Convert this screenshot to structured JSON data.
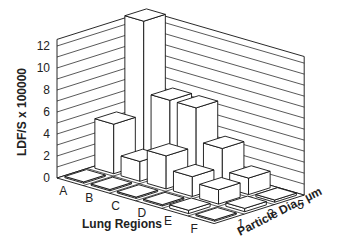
{
  "chart_data": {
    "type": "bar3d",
    "title": "",
    "xlabel": "Lung Regions",
    "ylabel": "Particle Dia., µm",
    "zlabel": "LDF/S x 100000",
    "categories": [
      "A",
      "B",
      "C",
      "D",
      "E",
      "F"
    ],
    "depth_categories": [
      "1",
      "3",
      "5"
    ],
    "zlim": [
      0,
      12
    ],
    "z_ticks": [
      "0",
      "2",
      "4",
      "6",
      "8",
      "10",
      "12"
    ],
    "grid": true,
    "series": [
      {
        "name": "1",
        "values": [
          0.1,
          0.1,
          0.1,
          0.1,
          0.3,
          0.1
        ]
      },
      {
        "name": "3",
        "values": [
          4.5,
          1.8,
          3.0,
          1.8,
          1.3,
          0.3
        ]
      },
      {
        "name": "5",
        "values": [
          13.0,
          6.5,
          6.5,
          3.5,
          1.5,
          0.2
        ]
      }
    ]
  }
}
